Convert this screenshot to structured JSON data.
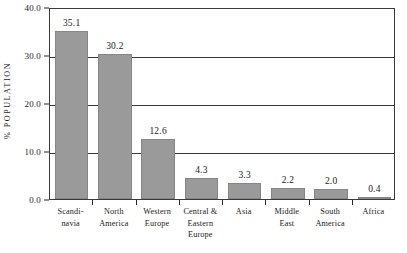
{
  "chart_data": {
    "type": "bar",
    "title": "",
    "subtitle": "",
    "xlabel": "",
    "ylabel": "% POPULATION",
    "ylim": [
      0.0,
      40.0
    ],
    "ytick_step": 10.0,
    "ytick_labels": [
      "0.0",
      "10.0",
      "20.0",
      "30.0",
      "40.0"
    ],
    "ytick_values": [
      0.0,
      10.0,
      20.0,
      30.0,
      40.0
    ],
    "grid": true,
    "grid_axis": "y",
    "legend": false,
    "legend_position": "none",
    "orientation": "vertical",
    "bar_color": "#9a9a9a",
    "bar_edge_color": "#868686",
    "axis_color": "#3a3a3a",
    "text_color": "#1a1a1a",
    "background": "#ffffff",
    "value_labels_shown": true,
    "categories": [
      "Scandinavia",
      "North America",
      "Western Europe",
      "Central & Eastern Europe",
      "Asia",
      "Middle East",
      "South America",
      "Africa"
    ],
    "category_label_lines": [
      [
        "Scandi-",
        "navia"
      ],
      [
        "North",
        "America"
      ],
      [
        "Western",
        "Europe"
      ],
      [
        "Central &",
        "Eastern",
        "Europe"
      ],
      [
        "Asia"
      ],
      [
        "Middle",
        "East"
      ],
      [
        "South",
        "America"
      ],
      [
        "Africa"
      ]
    ],
    "values": [
      35.1,
      30.2,
      12.6,
      4.3,
      3.3,
      2.2,
      2.0,
      0.4
    ],
    "value_labels": [
      "35.1",
      "30.2",
      "12.6",
      "4.3",
      "3.3",
      "2.2",
      "2.0",
      "0.4"
    ]
  }
}
